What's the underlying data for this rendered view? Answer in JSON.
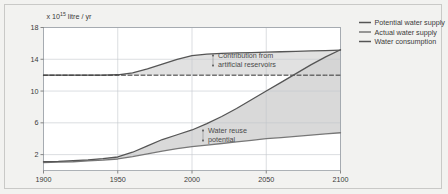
{
  "figure": {
    "background_color": "#f2f2f0",
    "plot_background_color": "#ffffff",
    "border_color": "#c9c9c7"
  },
  "axis": {
    "y_label_prefix": "x 10",
    "y_label_exponent": "15",
    "y_label_suffix": " litre / yr",
    "y_ticks": [
      "18",
      "14",
      "10",
      "6",
      "2"
    ],
    "x_ticks": [
      "1900",
      "1950",
      "2000",
      "2050",
      "2100"
    ]
  },
  "legend": {
    "position": "top-right",
    "items": [
      {
        "label": "Potential water supply",
        "color": "#555555"
      },
      {
        "label": "Actual water supply",
        "color": "#777777"
      },
      {
        "label": "Water consumption",
        "color": "#555555"
      }
    ]
  },
  "annotations": [
    {
      "line1": "Contribution from",
      "line2": "artificial reservoirs"
    },
    {
      "line1": "Water reuse",
      "line2": "potential"
    }
  ],
  "chart_data": {
    "type": "area",
    "title": "",
    "xlabel": "",
    "ylabel": "x 10^15 litre / yr",
    "xlim": [
      1900,
      2100
    ],
    "ylim": [
      0,
      18
    ],
    "grid": true,
    "x": [
      1900,
      1910,
      1920,
      1930,
      1940,
      1950,
      1960,
      1970,
      1980,
      1990,
      2000,
      2010,
      2020,
      2030,
      2040,
      2050,
      2060,
      2070,
      2080,
      2090,
      2100
    ],
    "series": [
      {
        "name": "Potential water supply",
        "color": "#555555",
        "style": "solid",
        "values": [
          12.0,
          12.0,
          12.0,
          12.0,
          12.0,
          12.05,
          12.3,
          12.8,
          13.4,
          14.0,
          14.45,
          14.65,
          14.75,
          14.8,
          14.85,
          14.9,
          14.95,
          15.0,
          15.05,
          15.1,
          15.15
        ]
      },
      {
        "name": "Natural water supply (no reservoirs)",
        "color": "#333333",
        "style": "dashed",
        "values": [
          12.0,
          12.0,
          12.0,
          12.0,
          12.0,
          12.0,
          12.0,
          12.0,
          12.0,
          12.0,
          12.0,
          12.0,
          12.0,
          12.0,
          12.0,
          12.0,
          12.0,
          12.0,
          12.0,
          12.0,
          12.0
        ]
      },
      {
        "name": "Actual water supply",
        "color": "#777777",
        "style": "solid",
        "values": [
          1.0,
          1.05,
          1.1,
          1.2,
          1.3,
          1.45,
          1.75,
          2.1,
          2.45,
          2.75,
          3.0,
          3.2,
          3.4,
          3.6,
          3.8,
          4.0,
          4.15,
          4.3,
          4.45,
          4.6,
          4.75
        ]
      },
      {
        "name": "Water consumption",
        "color": "#555555",
        "style": "solid",
        "values": [
          1.1,
          1.15,
          1.25,
          1.35,
          1.5,
          1.7,
          2.3,
          3.1,
          3.9,
          4.5,
          5.1,
          5.9,
          6.8,
          7.8,
          8.9,
          10.0,
          11.1,
          12.2,
          13.3,
          14.3,
          15.2
        ]
      }
    ],
    "shaded_regions": [
      {
        "name": "Contribution from artificial reservoirs",
        "between": [
          "Natural water supply (no reservoirs)",
          "Potential water supply"
        ],
        "color": "#dcdcdc"
      },
      {
        "name": "Water reuse potential",
        "between": [
          "Actual water supply",
          "Water consumption"
        ],
        "color": "#d2d2d2"
      }
    ]
  }
}
